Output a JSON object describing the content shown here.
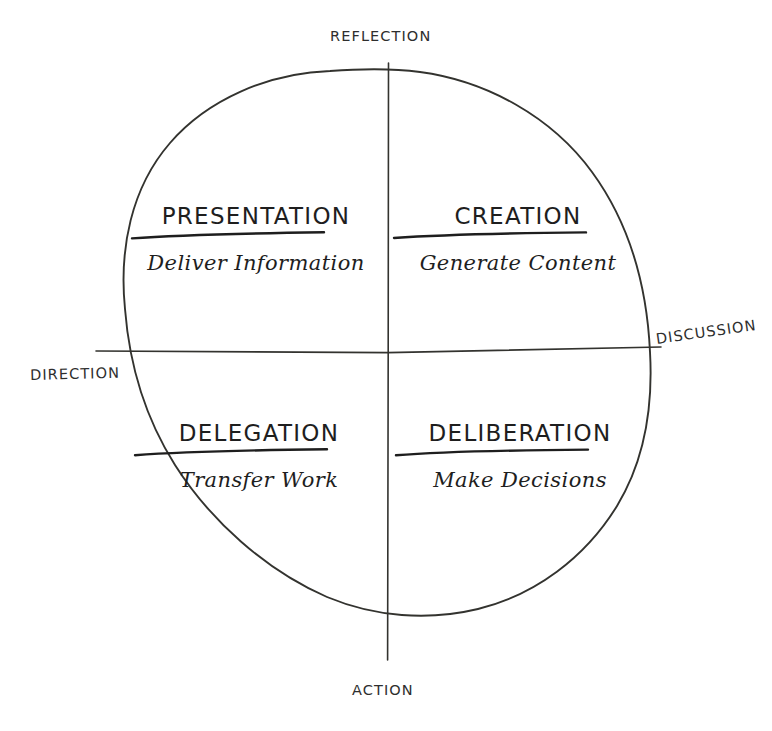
{
  "diagram": {
    "style": "hand-drawn-sketch",
    "background_color": "#ffffff",
    "ink_color": "#2b2b2b",
    "shape": "circle-divided-into-four-quadrants"
  },
  "axes": {
    "vertical": {
      "top_label": "REFLECTION",
      "bottom_label": "ACTION"
    },
    "horizontal": {
      "left_label": "DIRECTION",
      "right_label": "DISCUSSION"
    }
  },
  "quadrants": [
    {
      "position": "top-left",
      "title": "PRESENTATION",
      "subtitle": "Deliver Information",
      "underlined": true
    },
    {
      "position": "top-right",
      "title": "CREATION",
      "subtitle": "Generate Content",
      "underlined": true
    },
    {
      "position": "bottom-left",
      "title": "DELEGATION",
      "subtitle": "Transfer Work",
      "underlined": true
    },
    {
      "position": "bottom-right",
      "title": "DELIBERATION",
      "subtitle": "Make Decisions",
      "underlined": true
    }
  ]
}
